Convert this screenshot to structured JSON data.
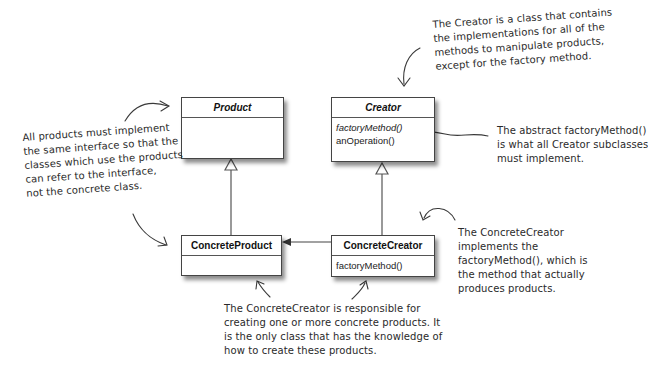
{
  "classes": {
    "product": {
      "name": "Product",
      "abstract": true,
      "methods": []
    },
    "creator": {
      "name": "Creator",
      "abstract": true,
      "methods": [
        {
          "label": "factoryMethod()",
          "italic": true
        },
        {
          "label": "anOperation()",
          "italic": false
        }
      ]
    },
    "concrete_product": {
      "name": "ConcreteProduct",
      "abstract": false,
      "methods": []
    },
    "concrete_creator": {
      "name": "ConcreteCreator",
      "abstract": false,
      "methods": [
        {
          "label": "factoryMethod()",
          "italic": false
        }
      ]
    }
  },
  "annotations": {
    "creator_note": [
      "The Creator is a class that contains",
      "the implementations for all of the",
      "methods to manipulate products,",
      "except for the factory method."
    ],
    "abstract_note": [
      "The abstract factoryMethod()",
      "is what all Creator subclasses",
      "must implement."
    ],
    "products_note": [
      "All products must implement",
      "the same interface so that the",
      "classes which use the products",
      "can refer to the interface,",
      "not the concrete class."
    ],
    "concrete_creator_note": [
      "The ConcreteCreator",
      "implements the",
      "factoryMethod(), which is",
      "the method that actually",
      "produces products."
    ],
    "responsibility_note": [
      "The ConcreteCreator is responsible for",
      "creating one or more concrete products.  It",
      "is the only class that has the knowledge of",
      "how to create these products."
    ]
  },
  "relationships": [
    {
      "type": "generalization",
      "from": "ConcreteProduct",
      "to": "Product"
    },
    {
      "type": "generalization",
      "from": "ConcreteCreator",
      "to": "Creator"
    },
    {
      "type": "dependency",
      "from": "ConcreteCreator",
      "to": "ConcreteProduct"
    }
  ]
}
